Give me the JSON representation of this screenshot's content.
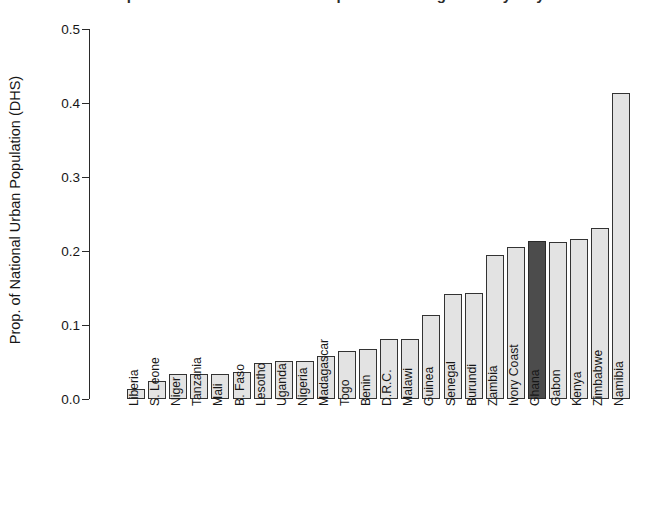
{
  "chart_data": {
    "type": "bar",
    "title": "",
    "xlabel": "",
    "ylabel": "Prop. of National Urban Population (DHS)",
    "ylim": [
      0.0,
      0.5
    ],
    "ytick_labels": [
      "0.0",
      "0.1",
      "0.2",
      "0.3",
      "0.4",
      "0.5"
    ],
    "ytick_values": [
      0.0,
      0.1,
      0.2,
      0.3,
      0.4,
      0.5
    ],
    "grid": false,
    "legend": null,
    "categories": [
      "Liberia",
      "S. Leone",
      "Niger",
      "Tanzania",
      "Mali",
      "B. Faso",
      "Lesotho",
      "Uganda",
      "Nigeria",
      "Madagascar",
      "Togo",
      "Benin",
      "D.R.C.",
      "Malawi",
      "Guinea",
      "Senegal",
      "Burundi",
      "Zambia",
      "Ivory Coast",
      "Ghana",
      "Gabon",
      "Kenya",
      "Zimbabwe",
      "Namibia"
    ],
    "values": [
      0.014,
      0.024,
      0.034,
      0.034,
      0.034,
      0.036,
      0.048,
      0.052,
      0.052,
      0.058,
      0.065,
      0.068,
      0.081,
      0.081,
      0.113,
      0.142,
      0.143,
      0.194,
      0.205,
      0.213,
      0.212,
      0.216,
      0.231,
      0.413
    ],
    "highlight_category": "Ghana",
    "colors": {
      "bar_fill": "#e3e3e3",
      "bar_border": "#333333",
      "highlight_fill": "#4c4c4c",
      "axis": "#2a2a2a",
      "text": "#161616",
      "background": "#ffffff"
    }
  },
  "figure": {
    "clipped_title": "Proportion of National Urban Population Living in Study City"
  }
}
